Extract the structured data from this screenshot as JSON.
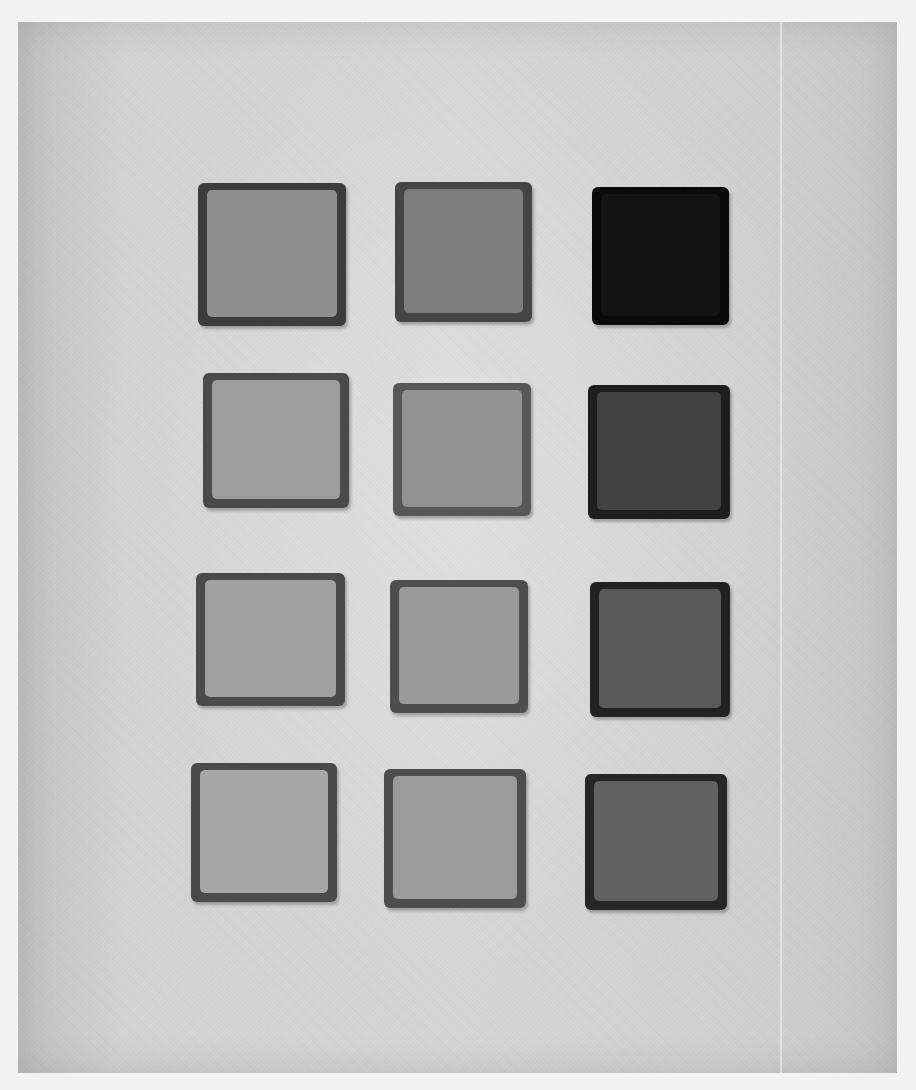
{
  "image": {
    "description": "Grayscale photograph of twelve square tiles arranged in a 3-column by 4-row grid on a mottled light-gray paper background",
    "background_color": "#d4d4d4",
    "page_color": "#f2f2f2",
    "grid": {
      "rows": 4,
      "columns": 3
    },
    "tiles": [
      {
        "row": 1,
        "col": 1,
        "x": 198,
        "y": 183,
        "w": 148,
        "h": 143,
        "face": "#8e8e8e",
        "edge": "#3c3c3c"
      },
      {
        "row": 1,
        "col": 2,
        "x": 395,
        "y": 182,
        "w": 137,
        "h": 140,
        "face": "#7c7c7c",
        "edge": "#444444"
      },
      {
        "row": 1,
        "col": 3,
        "x": 592,
        "y": 187,
        "w": 137,
        "h": 138,
        "face": "#141414",
        "edge": "#0a0a0a"
      },
      {
        "row": 2,
        "col": 1,
        "x": 203,
        "y": 373,
        "w": 146,
        "h": 135,
        "face": "#9d9d9d",
        "edge": "#4a4a4a"
      },
      {
        "row": 2,
        "col": 2,
        "x": 393,
        "y": 383,
        "w": 138,
        "h": 133,
        "face": "#939393",
        "edge": "#575757"
      },
      {
        "row": 2,
        "col": 3,
        "x": 588,
        "y": 385,
        "w": 142,
        "h": 134,
        "face": "#424242",
        "edge": "#1e1e1e"
      },
      {
        "row": 3,
        "col": 1,
        "x": 196,
        "y": 573,
        "w": 149,
        "h": 133,
        "face": "#a0a0a0",
        "edge": "#4a4a4a"
      },
      {
        "row": 3,
        "col": 2,
        "x": 390,
        "y": 580,
        "w": 138,
        "h": 133,
        "face": "#999999",
        "edge": "#4e4e4e"
      },
      {
        "row": 3,
        "col": 3,
        "x": 590,
        "y": 582,
        "w": 140,
        "h": 135,
        "face": "#5a5a5a",
        "edge": "#222222"
      },
      {
        "row": 4,
        "col": 1,
        "x": 191,
        "y": 763,
        "w": 146,
        "h": 139,
        "face": "#a6a6a6",
        "edge": "#4a4a4a"
      },
      {
        "row": 4,
        "col": 2,
        "x": 384,
        "y": 769,
        "w": 142,
        "h": 139,
        "face": "#9c9c9c",
        "edge": "#4e4e4e"
      },
      {
        "row": 4,
        "col": 3,
        "x": 585,
        "y": 774,
        "w": 142,
        "h": 136,
        "face": "#626262",
        "edge": "#262626"
      }
    ]
  }
}
